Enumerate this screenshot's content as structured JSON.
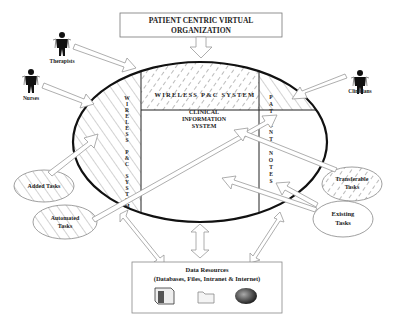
{
  "title": {
    "line1": "PATIENT CENTRIC VIRTUAL",
    "line2": "ORGANIZATION"
  },
  "actors": [
    {
      "label": "Therapists",
      "icon": "person-icon"
    },
    {
      "label": "Nurses",
      "icon": "person-icon"
    },
    {
      "label": "Clinicians",
      "icon": "person-icon"
    }
  ],
  "core": {
    "wireless_top": "WIRELESS P&C SYSTEM",
    "wireless_side": [
      "W",
      "I",
      "R",
      "E",
      "L",
      "E",
      "S",
      "S",
      "",
      "P",
      "&",
      "C",
      "",
      "S",
      "Y",
      "S",
      "T",
      "E",
      "M"
    ],
    "clinical": {
      "line1": "CLINICAL",
      "line2": "INFORMATION",
      "line3": "SYSTEM"
    },
    "patient_notes": [
      "P",
      "A",
      "T",
      "I",
      "E",
      "N",
      "T",
      "",
      "N",
      "O",
      "T",
      "E",
      "S"
    ]
  },
  "tasks": {
    "added": "Added Tasks",
    "automated": {
      "line1": "Automated",
      "line2": "Tasks"
    },
    "transferable": {
      "line1": "Transferable",
      "line2": "Tasks"
    },
    "existing": {
      "line1": "Existing",
      "line2": "Tasks"
    }
  },
  "data_resources": {
    "title": "Data Resources",
    "subtitle": "(Databases, Files, Intranet & Internet)",
    "icons": [
      "server-icon",
      "folder-icon",
      "globe-icon"
    ]
  }
}
